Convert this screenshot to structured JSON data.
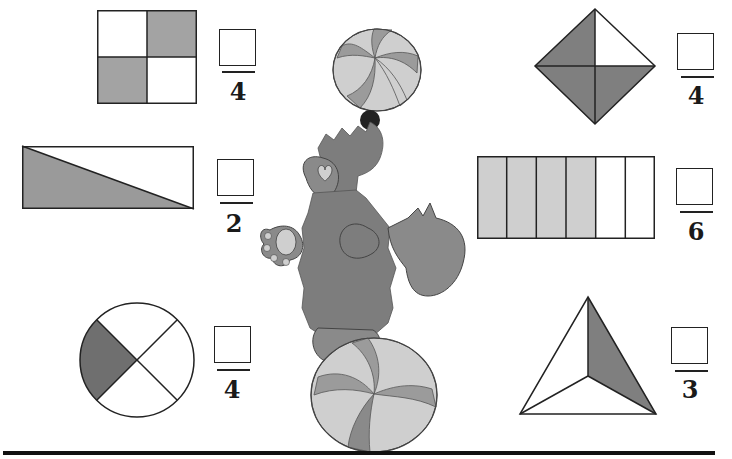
{
  "worksheet": {
    "topic": "Fractions - write the numerator for the shaded parts",
    "colors": {
      "shade": "#9a9a9a",
      "light_shade": "#c8c8c8",
      "dark_shade": "#6f6f6f",
      "outline": "#222222",
      "bear": "#7d7d7d",
      "ball_light": "#cfcfcf",
      "ball_dark": "#9b9b9b"
    },
    "problems": [
      {
        "id": "square-quarters",
        "shape": "square divided into 4",
        "shaded": 2,
        "numerator": "",
        "denominator": "4"
      },
      {
        "id": "rectangle-halves",
        "shape": "rectangle divided diagonally into 2",
        "shaded": 1,
        "numerator": "",
        "denominator": "2"
      },
      {
        "id": "circle-quarters",
        "shape": "circle divided into 4",
        "shaded": 1,
        "numerator": "",
        "denominator": "4"
      },
      {
        "id": "diamond-quarters",
        "shape": "diamond divided into 4",
        "shaded": 3,
        "numerator": "",
        "denominator": "4"
      },
      {
        "id": "rectangle-sixths",
        "shape": "rectangle divided into 6 columns",
        "shaded": 4,
        "numerator": "",
        "denominator": "6"
      },
      {
        "id": "triangle-thirds",
        "shape": "triangle divided into 3",
        "shaded": 1,
        "numerator": "",
        "denominator": "3"
      }
    ],
    "illustration": "Bear balancing one ball on its nose and standing on another ball"
  }
}
